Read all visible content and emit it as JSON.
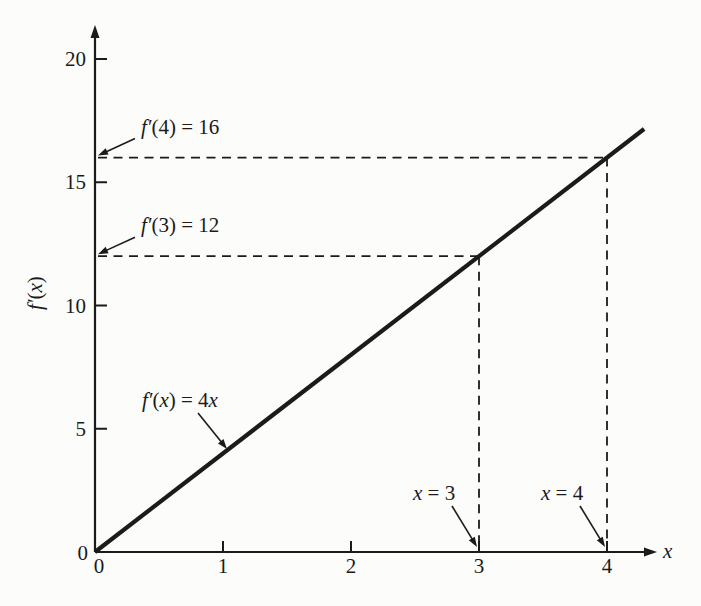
{
  "figure": {
    "background": "#fcfcfa",
    "ink": "#1b1b1b"
  },
  "chart_data": {
    "type": "line",
    "title": "",
    "xlabel": "x",
    "ylabel": "f′(x)",
    "xlim": [
      0,
      4.6
    ],
    "ylim": [
      0,
      21.5
    ],
    "x_ticks": [
      0,
      1,
      2,
      3,
      4
    ],
    "y_ticks": [
      0,
      5,
      10,
      15,
      20
    ],
    "grid": false,
    "legend": "none",
    "series": [
      {
        "name": "f′(x) = 4x",
        "label": "f′(x) = 4x",
        "slope": 4,
        "intercept": 0,
        "x": [
          0,
          4.29
        ],
        "y": [
          0,
          17.16
        ]
      }
    ],
    "guide_points": [
      {
        "x": 3,
        "y": 12,
        "x_label": "x = 3",
        "y_label": "f′(3) = 12"
      },
      {
        "x": 4,
        "y": 16,
        "x_label": "x = 4",
        "y_label": "f′(4) = 16"
      }
    ]
  }
}
